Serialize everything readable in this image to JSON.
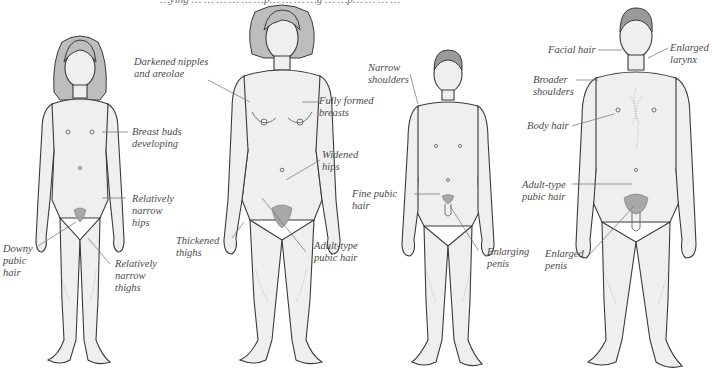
{
  "figure": {
    "top_caption": "…ying … … … … … …p… … … …g … …p… … … …",
    "figures": [
      {
        "id": "girl",
        "description": "Pubescent girl",
        "labels": [
          {
            "text": "Breast buds\ndeveloping"
          },
          {
            "text": "Relatively\nnarrow\nhips"
          },
          {
            "text": "Downy\npubic\nhair"
          },
          {
            "text": "Relatively\nnarrow\nthighs"
          }
        ]
      },
      {
        "id": "woman",
        "description": "Adult woman",
        "labels": [
          {
            "text": "Darkened nipples\nand areolae"
          },
          {
            "text": "Fully formed\nbreasts"
          },
          {
            "text": "Widened\nhips"
          },
          {
            "text": "Thickened\nthighs"
          },
          {
            "text": "Adult-type\npubic hair"
          }
        ]
      },
      {
        "id": "boy",
        "description": "Pubescent boy",
        "labels": [
          {
            "text": "Narrow\nshoulders"
          },
          {
            "text": "Fine pubic\nhair"
          },
          {
            "text": "Enlarging\npenis"
          }
        ]
      },
      {
        "id": "man",
        "description": "Adult man",
        "labels": [
          {
            "text": "Facial hair"
          },
          {
            "text": "Enlarged\nlarynx"
          },
          {
            "text": "Broader\nshoulders"
          },
          {
            "text": "Body hair"
          },
          {
            "text": "Adult-type\npubic hair"
          },
          {
            "text": "Enlarged\npenis"
          }
        ]
      }
    ]
  },
  "colors": {
    "background": "#ffffff",
    "label_text": "#4a4a4a",
    "outline": "#3a3a3a",
    "skin": "#efefef"
  }
}
